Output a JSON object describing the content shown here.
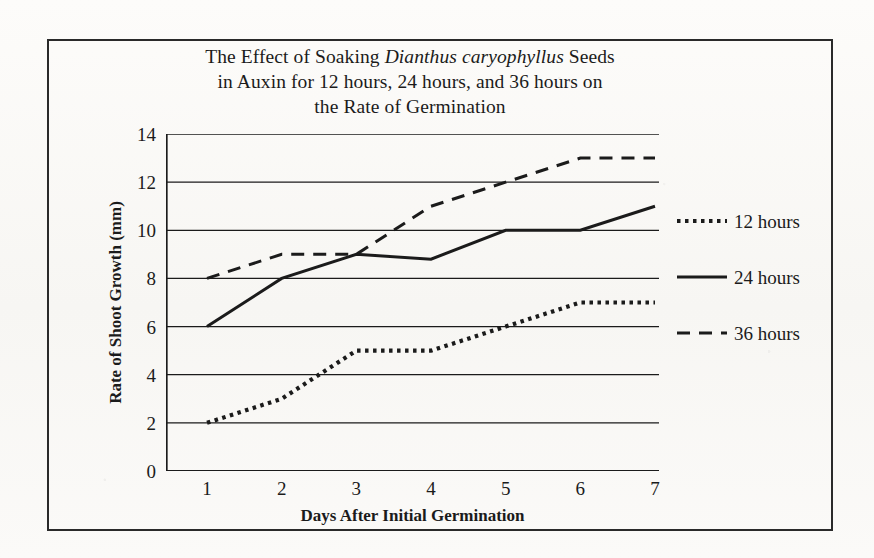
{
  "figure": {
    "title_line1_a": "The Effect of Soaking ",
    "title_line1_italic": "Dianthus caryophyllus",
    "title_line1_b": " Seeds",
    "title_line2": "in Auxin for 12 hours, 24 hours, and 36 hours on",
    "title_line3": "the Rate of Germination",
    "border_color": "#2a2a2a",
    "ink_color": "#1b1b1b",
    "paper_color": "#fbfaf8"
  },
  "chart_data": {
    "type": "line",
    "title": "The Effect of Soaking Dianthus caryophyllus Seeds in Auxin for 12 hours, 24 hours, and 36 hours on the Rate of Germination",
    "xlabel": "Days After Initial Germination",
    "ylabel": "Rate of Shoot Growth (mm)",
    "x": [
      1,
      2,
      3,
      4,
      5,
      6,
      7
    ],
    "categories": [
      "1",
      "2",
      "3",
      "4",
      "5",
      "6",
      "7"
    ],
    "xlim": [
      1,
      7
    ],
    "ylim": [
      0,
      14
    ],
    "yticks": [
      0,
      2,
      4,
      6,
      8,
      10,
      12,
      14
    ],
    "ytick_labels": [
      "0",
      "2",
      "4",
      "6",
      "8",
      "10",
      "12",
      "14"
    ],
    "grid": "horizontal",
    "legend_position": "right",
    "series": [
      {
        "name": "12 hours",
        "style": "dotted",
        "color": "#1b1b1b",
        "values": [
          2,
          3,
          5,
          5,
          6,
          7,
          7
        ]
      },
      {
        "name": "24 hours",
        "style": "solid",
        "color": "#1b1b1b",
        "values": [
          6,
          8,
          9,
          8.8,
          10,
          10,
          11
        ]
      },
      {
        "name": "36 hours",
        "style": "dashed",
        "color": "#1b1b1b",
        "values": [
          8,
          9,
          9,
          11,
          12,
          13,
          13
        ]
      }
    ]
  },
  "legend": {
    "items": [
      {
        "label": "12 hours",
        "style": "dotted"
      },
      {
        "label": "24 hours",
        "style": "solid"
      },
      {
        "label": "36 hours",
        "style": "dashed"
      }
    ]
  }
}
